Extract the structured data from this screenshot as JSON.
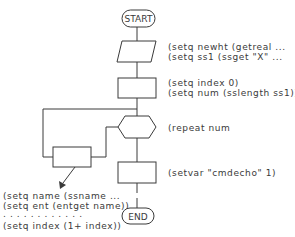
{
  "diagram": {
    "type": "flowchart",
    "terminals": {
      "start": "START",
      "end": "END"
    },
    "steps": [
      {
        "shape": "parallelogram",
        "lines": [
          "(setq newht (getreal ...",
          "(setq ss1 (ssget \"X\" ..."
        ]
      },
      {
        "shape": "rectangle",
        "lines": [
          "(setq index 0)",
          "(setq num (sslength ss1))"
        ]
      },
      {
        "shape": "hexagon",
        "lines": [
          "(repeat num"
        ]
      },
      {
        "shape": "rectangle",
        "lines": [
          "(setvar \"cmdecho\" 1)"
        ]
      }
    ],
    "loop_body": {
      "shape": "rectangle",
      "lines": [
        "(setq name (ssname ...",
        "(setq ent (entget name))",
        ". . . . . . . . . . . .",
        "(setq index (1+ index))"
      ]
    },
    "colors": {
      "stroke": "#3a3a3a",
      "background": "#ffffff"
    }
  }
}
